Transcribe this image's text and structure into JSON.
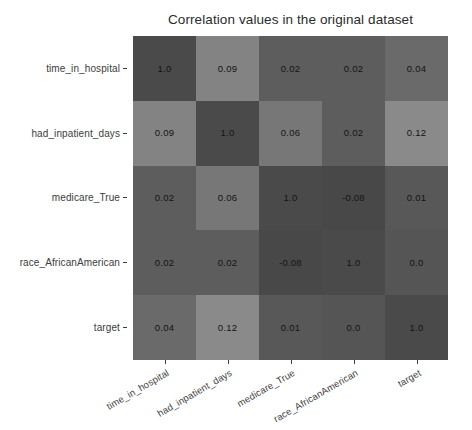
{
  "chart_data": {
    "type": "heatmap",
    "title": "Correlation values in the original dataset",
    "xlabel": "",
    "ylabel": "",
    "categories": [
      "time_in_hospital",
      "had_inpatient_days",
      "medicare_True",
      "race_AfricanAmerican",
      "target"
    ],
    "x_tick_labels": [
      "time_in_hospital",
      "had_inpatient_days",
      "medicare_True",
      "race_AfricanAmerican",
      "target"
    ],
    "y_tick_labels": [
      "time_in_hospital",
      "had_inpatient_days",
      "medicare_True",
      "race_AfricanAmerican",
      "target"
    ],
    "rows": [
      {
        "label": "time_in_hospital",
        "values": [
          1.0,
          0.09,
          0.02,
          0.02,
          0.04
        ],
        "labels": [
          "1.0",
          "0.09",
          "0.02",
          "0.02",
          "0.04"
        ]
      },
      {
        "label": "had_inpatient_days",
        "values": [
          0.09,
          1.0,
          0.06,
          0.02,
          0.12
        ],
        "labels": [
          "0.09",
          "1.0",
          "0.06",
          "0.02",
          "0.12"
        ]
      },
      {
        "label": "medicare_True",
        "values": [
          0.02,
          0.06,
          1.0,
          -0.08,
          0.01
        ],
        "labels": [
          "0.02",
          "0.06",
          "1.0",
          "-0.08",
          "0.01"
        ]
      },
      {
        "label": "race_AfricanAmerican",
        "values": [
          0.02,
          0.02,
          -0.08,
          1.0,
          0.0
        ],
        "labels": [
          "0.02",
          "0.02",
          "-0.08",
          "1.0",
          "0.0"
        ]
      },
      {
        "label": "target",
        "values": [
          0.04,
          0.12,
          0.01,
          0.0,
          1.0
        ],
        "labels": [
          "0.04",
          "0.12",
          "0.01",
          "0.0",
          "1.0"
        ]
      }
    ],
    "cell_colors": [
      [
        "#4a4a4a",
        "#838383",
        "#5d5d5d",
        "#5d5d5d",
        "#6a6a6a"
      ],
      [
        "#838383",
        "#4a4a4a",
        "#777777",
        "#5d5d5d",
        "#8a8a8a"
      ],
      [
        "#5d5d5d",
        "#777777",
        "#4a4a4a",
        "#484848",
        "#585858"
      ],
      [
        "#5d5d5d",
        "#5d5d5d",
        "#484848",
        "#4a4a4a",
        "#555555"
      ],
      [
        "#6a6a6a",
        "#8a8a8a",
        "#585858",
        "#555555",
        "#4a4a4a"
      ]
    ],
    "colormap": "grayscale-reversed",
    "value_range": [
      -0.08,
      1.0
    ],
    "grid": false,
    "legend": false,
    "annotations_shown": true,
    "x_tick_rotation_deg": -30,
    "background_color": "#ffffff",
    "text_color": "#3c3c3c",
    "annotation_text_color": "#141414"
  }
}
